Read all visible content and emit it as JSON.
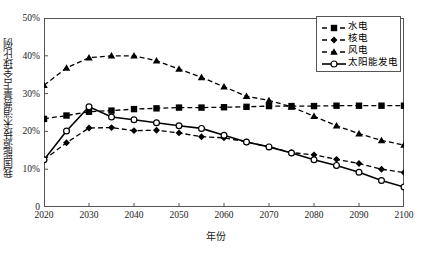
{
  "chart_data": {
    "type": "line",
    "title": "",
    "xlabel": "年份",
    "ylabel": "我国能源技术消费量占全球比例",
    "x": [
      2020,
      2025,
      2030,
      2035,
      2040,
      2045,
      2050,
      2055,
      2060,
      2065,
      2070,
      2075,
      2080,
      2085,
      2090,
      2095,
      2100
    ],
    "xlim": [
      2020,
      2100
    ],
    "ylim": [
      0,
      50
    ],
    "xtick_labels": [
      "2020",
      "2030",
      "2040",
      "2050",
      "2060",
      "2070",
      "2080",
      "2090",
      "2100"
    ],
    "xtick_values": [
      2020,
      2030,
      2040,
      2050,
      2060,
      2070,
      2080,
      2090,
      2100
    ],
    "ytick_labels": [
      "0",
      "10%",
      "20%",
      "30%",
      "40%",
      "50%"
    ],
    "ytick_values": [
      0,
      10,
      20,
      30,
      40,
      50
    ],
    "grid": false,
    "legend_position": "top-right",
    "series": [
      {
        "name": "水电",
        "marker": "square",
        "linestyle": "dashed",
        "color": "#000000",
        "values": [
          23.3,
          24.2,
          25.2,
          25.5,
          25.9,
          26.1,
          26.3,
          26.3,
          26.4,
          26.5,
          26.7,
          26.7,
          26.7,
          26.8,
          26.8,
          26.8,
          26.8
        ]
      },
      {
        "name": "核电",
        "marker": "diamond",
        "linestyle": "dashed",
        "color": "#000000",
        "values": [
          12.5,
          17.0,
          20.9,
          21.0,
          20.2,
          20.3,
          19.6,
          18.6,
          18.3,
          17.2,
          15.9,
          14.4,
          13.8,
          12.6,
          11.5,
          10.0,
          9.1
        ]
      },
      {
        "name": "风电",
        "marker": "triangle",
        "linestyle": "dashed",
        "color": "#000000",
        "values": [
          32.2,
          36.8,
          39.5,
          40.0,
          40.0,
          38.7,
          36.5,
          34.3,
          31.8,
          29.3,
          28.2,
          26.5,
          24.0,
          21.5,
          19.4,
          17.6,
          16.4
        ]
      },
      {
        "name": "太阳能发电",
        "marker": "circle",
        "linestyle": "solid",
        "color": "#000000",
        "values": [
          12.5,
          20.1,
          26.5,
          23.8,
          23.1,
          22.3,
          21.5,
          20.8,
          19.0,
          17.2,
          15.9,
          14.3,
          12.5,
          11.0,
          9.2,
          7.0,
          5.3
        ]
      }
    ]
  }
}
